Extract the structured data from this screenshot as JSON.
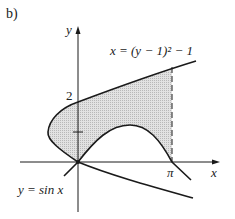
{
  "figure": {
    "part_label": "b)",
    "axes": {
      "x_label": "x",
      "y_label": "y",
      "x_tick_label": "π",
      "y_tick_label": "2"
    },
    "curves": {
      "parabola_label": "x = (y − 1)² − 1",
      "sine_label": "y = sin x"
    },
    "shaded_region": "region between x = (y − 1)² − 1 and y = sin x, 0 ≤ x ≤ π",
    "colors": {
      "stroke": "#1a1a1a",
      "shade": "#d4d4d4"
    }
  }
}
